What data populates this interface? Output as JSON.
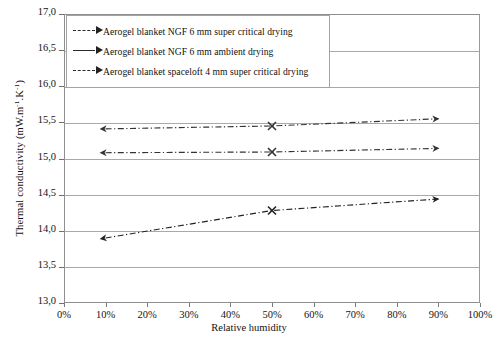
{
  "chart_data": {
    "type": "line",
    "title": "",
    "xlabel": "Relative humidity",
    "ylabel": "Thermal conductivity (mW.m-1.K-1)",
    "ylabel_display": "Thermal conductivity (mW.m",
    "ylabel_sup1": "-1",
    "ylabel_mid": ".K",
    "ylabel_sup2": "-1",
    "ylabel_end": ")",
    "x": [
      10,
      50,
      90
    ],
    "xlim": [
      0,
      100
    ],
    "ylim": [
      13.0,
      17.0
    ],
    "xticks": [
      0,
      10,
      20,
      30,
      40,
      50,
      60,
      70,
      80,
      90,
      100
    ],
    "xtick_labels": [
      "0%",
      "10%",
      "20%",
      "30%",
      "40%",
      "50%",
      "60%",
      "70%",
      "80%",
      "90%",
      "100%"
    ],
    "yticks": [
      13.0,
      13.5,
      14.0,
      14.5,
      15.0,
      15.5,
      16.0,
      16.5,
      17.0
    ],
    "ytick_labels": [
      "13,0",
      "13,5",
      "14,0",
      "14,5",
      "15,0",
      "15,5",
      "16,0",
      "16,5",
      "17,0"
    ],
    "grid": true,
    "legend_position": "upper-left-inside",
    "series": [
      {
        "name": "Aerogel blanket NGF 6 mm super critical drying",
        "values": [
          15.41,
          15.45,
          15.55
        ],
        "linestyle": "dash-dot",
        "color": "#333333",
        "marker": "arrow"
      },
      {
        "name": "Aerogel blanket NGF 6 mm ambient drying",
        "values": [
          15.08,
          15.09,
          15.14
        ],
        "linestyle": "dash-dot",
        "color": "#333333",
        "marker": "arrow"
      },
      {
        "name": "Aerogel blanket spaceloft 4 mm super critical drying",
        "values": [
          13.9,
          14.28,
          14.44
        ],
        "linestyle": "dash-dot",
        "color": "#222222",
        "marker": "arrow"
      }
    ]
  },
  "legend": {
    "items": [
      {
        "label": "Aerogel blanket NGF 6 mm super critical drying"
      },
      {
        "label": "Aerogel blanket NGF 6 mm ambient drying"
      },
      {
        "label": "Aerogel blanket spaceloft 4 mm super critical drying"
      }
    ]
  }
}
